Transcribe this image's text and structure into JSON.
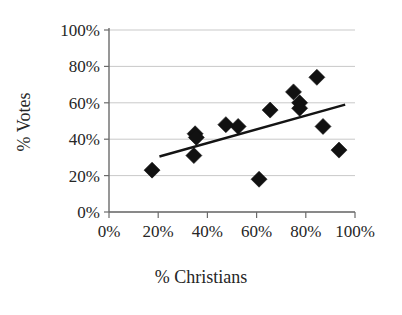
{
  "chart_data": {
    "type": "scatter",
    "title": "",
    "xlabel": "% Christians",
    "ylabel": "% Votes",
    "xlim": [
      0,
      100
    ],
    "ylim": [
      0,
      100
    ],
    "grid": true,
    "legend": null,
    "x_tick_labels": [
      "0%",
      "20%",
      "40%",
      "60%",
      "80%",
      "100%"
    ],
    "x_tick_values": [
      0,
      20,
      40,
      60,
      80,
      100
    ],
    "y_tick_labels": [
      "0%",
      "20%",
      "40%",
      "60%",
      "80%",
      "100%"
    ],
    "y_tick_values": [
      0,
      20,
      40,
      60,
      80,
      100
    ],
    "series": [
      {
        "name": "observations",
        "marker": "diamond",
        "color": "#111111",
        "points": [
          {
            "x": 17.5,
            "y": 23
          },
          {
            "x": 35.0,
            "y": 43
          },
          {
            "x": 35.5,
            "y": 41
          },
          {
            "x": 34.5,
            "y": 31
          },
          {
            "x": 47.5,
            "y": 48
          },
          {
            "x": 52.5,
            "y": 47
          },
          {
            "x": 61.0,
            "y": 18
          },
          {
            "x": 65.5,
            "y": 56
          },
          {
            "x": 75.0,
            "y": 66
          },
          {
            "x": 77.5,
            "y": 60
          },
          {
            "x": 77.5,
            "y": 57
          },
          {
            "x": 84.5,
            "y": 74
          },
          {
            "x": 87.0,
            "y": 47
          },
          {
            "x": 93.5,
            "y": 34
          }
        ]
      }
    ],
    "trendline": {
      "type": "linear-fit",
      "color": "#141414",
      "x_start": 20.5,
      "y_start": 30.5,
      "x_end": 96.0,
      "y_end": 59.0
    }
  }
}
